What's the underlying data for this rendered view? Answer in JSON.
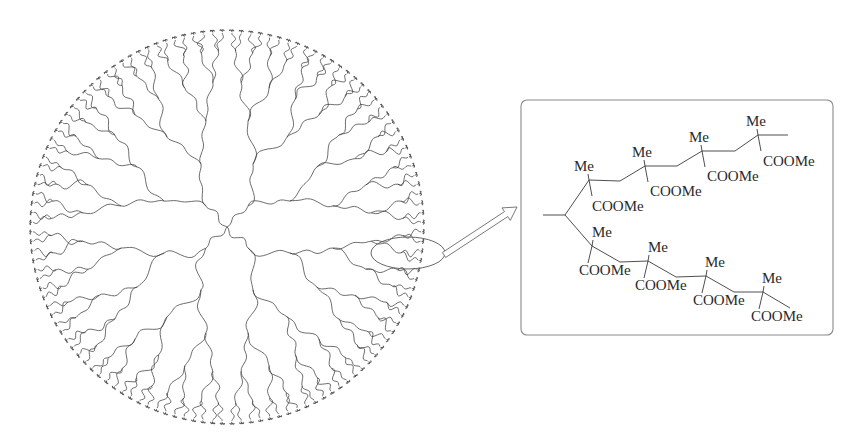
{
  "figure": {
    "background": "#ffffff",
    "line_color": "#3a3a3a"
  },
  "dendrimer": {
    "center": [
      227,
      227
    ],
    "radius": 198,
    "arms": 4,
    "arm_angles_deg": [
      -135,
      -45,
      45,
      135
    ],
    "generations": 5,
    "terminal_count": 128,
    "wave_amplitude": 4.0,
    "wave_frequency": 2.2
  },
  "highlight": {
    "ellipse": {
      "cx": 408,
      "cy": 253,
      "rx": 37,
      "ry": 16
    }
  },
  "arrow": {
    "from": [
      444,
      255
    ],
    "to": [
      517,
      207
    ],
    "shaft_width": 6,
    "head_width": 15,
    "head_length": 13
  },
  "inset": {
    "box": {
      "x": 521,
      "y": 100,
      "width": 312,
      "height": 235,
      "radius": 6
    },
    "upper_chain": {
      "backbone": [
        [
          565,
          215
        ],
        [
          589,
          180
        ],
        [
          620,
          181
        ],
        [
          645,
          166
        ],
        [
          677,
          166
        ],
        [
          702,
          151
        ],
        [
          735,
          151
        ],
        [
          758,
          135
        ],
        [
          788,
          135
        ]
      ],
      "quaternary_carbons": [
        [
          589,
          180
        ],
        [
          645,
          166
        ],
        [
          702,
          151
        ],
        [
          758,
          135
        ]
      ],
      "me_labels": [
        {
          "text": "Me",
          "x": 574,
          "y": 171
        },
        {
          "text": "Me",
          "x": 632,
          "y": 157
        },
        {
          "text": "Me",
          "x": 689,
          "y": 142
        },
        {
          "text": "Me",
          "x": 746,
          "y": 126
        }
      ],
      "coome_labels": [
        {
          "text": "COOMe",
          "x": 592,
          "y": 211
        },
        {
          "text": "COOMe",
          "x": 650,
          "y": 196
        },
        {
          "text": "COOMe",
          "x": 707,
          "y": 181
        },
        {
          "text": "COOMe",
          "x": 763,
          "y": 166
        }
      ]
    },
    "lower_chain": {
      "backbone": [
        [
          565,
          215
        ],
        [
          592,
          246
        ],
        [
          620,
          262
        ],
        [
          648,
          261
        ],
        [
          676,
          277
        ],
        [
          706,
          276
        ],
        [
          734,
          292
        ],
        [
          763,
          292
        ],
        [
          790,
          308
        ]
      ],
      "quaternary_carbons": [
        [
          592,
          246
        ],
        [
          648,
          261
        ],
        [
          706,
          276
        ],
        [
          763,
          292
        ]
      ],
      "me_labels": [
        {
          "text": "Me",
          "x": 592,
          "y": 237
        },
        {
          "text": "Me",
          "x": 648,
          "y": 252
        },
        {
          "text": "Me",
          "x": 705,
          "y": 267
        },
        {
          "text": "Me",
          "x": 762,
          "y": 283
        }
      ],
      "coome_labels": [
        {
          "text": "COOMe",
          "x": 579,
          "y": 275
        },
        {
          "text": "COOMe",
          "x": 635,
          "y": 290
        },
        {
          "text": "COOMe",
          "x": 693,
          "y": 305
        },
        {
          "text": "COOMe",
          "x": 751,
          "y": 321
        }
      ]
    },
    "core_stub": {
      "from": [
        543,
        215
      ],
      "to": [
        565,
        215
      ]
    }
  }
}
